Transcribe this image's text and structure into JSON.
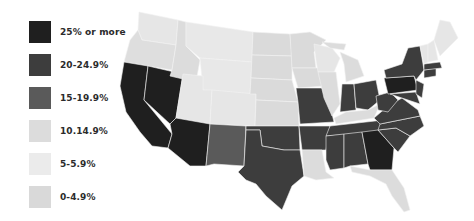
{
  "legend": {
    "items": [
      {
        "label": "25% or more",
        "color": "#1f1f1f"
      },
      {
        "label": "20-24.9%",
        "color": "#3d3d3d"
      },
      {
        "label": "15-19.9%",
        "color": "#5a5a5a"
      },
      {
        "label": "10.14.9%",
        "color": "#dcdcdc"
      },
      {
        "label": "5-5.9%",
        "color": "#ebebeb"
      },
      {
        "label": "0-4.9%",
        "color": "#d9d9d9"
      }
    ]
  },
  "map": {
    "region": "United States (contiguous)",
    "categories": {
      "25% or more": [
        "California",
        "Nevada",
        "Arizona",
        "Georgia",
        "Pennsylvania"
      ],
      "20-24.9%": [
        "Texas",
        "Oklahoma",
        "Missouri",
        "Arkansas",
        "Mississippi",
        "Alabama",
        "Tennessee",
        "South Carolina",
        "North Carolina",
        "Virginia",
        "West Virginia",
        "Ohio",
        "Indiana",
        "New York",
        "New Jersey",
        "Maryland",
        "Connecticut",
        "Massachusetts"
      ],
      "15-19.9%": [
        "New Mexico"
      ],
      "10.14.9%": [
        "Oregon",
        "Idaho",
        "Kentucky",
        "Louisiana",
        "Florida",
        "Michigan",
        "Illinois"
      ],
      "5-5.9%": [
        "Washington",
        "Montana",
        "Wyoming",
        "Utah",
        "Colorado",
        "Wisconsin",
        "Maine",
        "Vermont",
        "New Hampshire"
      ],
      "0-4.9%": [
        "North Dakota",
        "South Dakota",
        "Nebraska",
        "Kansas",
        "Minnesota",
        "Iowa"
      ]
    }
  }
}
